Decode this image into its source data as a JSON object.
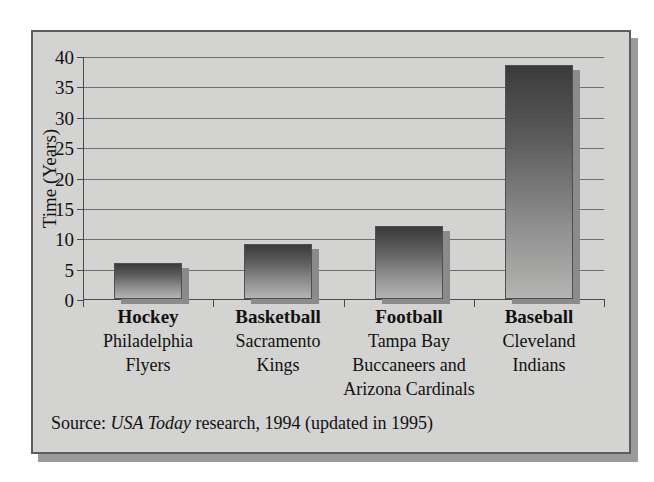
{
  "figure": {
    "source_prefix": "Source:",
    "source_italic": "USA Today",
    "source_suffix": "research, 1994 (updated in 1995)"
  },
  "colors": {
    "panel_background": "#d3d3d1",
    "panel_border": "#5d5d5d",
    "drop_shadow": "#9a9a9a",
    "gridline": "#6e6e6e",
    "axis": "#4a4a4a",
    "bar_top": "#3b3b3b",
    "bar_bottom": "#b4b4b2",
    "bar_shadow": "#8b8b8b",
    "text": "#111111"
  },
  "chart_data": {
    "type": "bar",
    "title": "",
    "xlabel": "",
    "ylabel": "Time (Years)",
    "ylim": [
      0,
      40
    ],
    "yticks": [
      0,
      5,
      10,
      15,
      20,
      25,
      30,
      35,
      40
    ],
    "ytick_labels": [
      "0",
      "5",
      "10",
      "15",
      "20",
      "25",
      "30",
      "35",
      "40"
    ],
    "grid": true,
    "legend": false,
    "categories": [
      "Hockey",
      "Basketball",
      "Football",
      "Baseball"
    ],
    "category_sublabels": [
      "Philadelphia Flyers",
      "Sacramento Kings",
      "Tampa Bay Buccaneers and Arizona Cardinals",
      "Cleveland Indians"
    ],
    "category_sublabel_lines": [
      [
        "Philadelphia",
        "Flyers"
      ],
      [
        "Sacramento",
        "Kings"
      ],
      [
        "Tampa Bay",
        "Buccaneers and",
        "Arizona Cardinals"
      ],
      [
        "Cleveland",
        "Indians"
      ]
    ],
    "values": [
      6,
      9,
      12,
      38.5
    ],
    "series": [
      {
        "name": "Time since championship",
        "values": [
          6,
          9,
          12,
          38.5
        ]
      }
    ]
  }
}
